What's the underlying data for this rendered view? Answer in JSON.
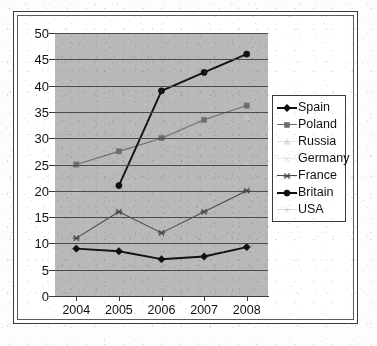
{
  "chart_data": {
    "type": "line",
    "title": "",
    "subtitle": "",
    "xlabel": "",
    "ylabel": "",
    "categories": [
      "2004",
      "2005",
      "2006",
      "2007",
      "2008"
    ],
    "x_tick_labels": [
      "2004",
      "2005",
      "2006",
      "2007",
      "2008"
    ],
    "y_tick_labels": [
      "0",
      "5",
      "10",
      "15",
      "20",
      "25",
      "30",
      "35",
      "40",
      "45",
      "50"
    ],
    "y_ticks": [
      0,
      5,
      10,
      15,
      20,
      25,
      30,
      35,
      40,
      45,
      50
    ],
    "ylim": [
      0,
      50
    ],
    "grid": "horizontal",
    "legend_position": "right",
    "plot_background": "#b9b9b9",
    "series": [
      {
        "name": "Spain",
        "marker": "diamond",
        "color": "#111111",
        "line_weight": "bold",
        "values": [
          9,
          8.5,
          7,
          7.5,
          9.3
        ]
      },
      {
        "name": "Poland",
        "marker": "square",
        "color": "#6e6e6e",
        "line_weight": "normal",
        "values": [
          25,
          27.5,
          30,
          33.5,
          36.2
        ]
      },
      {
        "name": "Russia",
        "marker": "triangle",
        "color": "#c9c9c9",
        "line_weight": "faint",
        "values": [
          null,
          null,
          null,
          null,
          34
        ]
      },
      {
        "name": "Germany",
        "marker": "cross",
        "color": "#d4d4d4",
        "line_weight": "faint",
        "values": [
          20,
          null,
          29.8,
          null,
          25
        ]
      },
      {
        "name": "France",
        "marker": "star",
        "color": "#4a4a4a",
        "line_weight": "normal",
        "values": [
          11,
          16,
          12,
          16,
          20
        ]
      },
      {
        "name": "Britain",
        "marker": "circle",
        "color": "#111111",
        "line_weight": "bold",
        "values": [
          null,
          21,
          39,
          42.5,
          46
        ]
      },
      {
        "name": "USA",
        "marker": "plus",
        "color": "#bdbdbd",
        "line_weight": "faint",
        "values": [
          9,
          8.5,
          7,
          7.2,
          7.5
        ]
      }
    ]
  },
  "legend": {
    "items": [
      {
        "label": "Spain"
      },
      {
        "label": "Poland"
      },
      {
        "label": "Russia"
      },
      {
        "label": "Germany"
      },
      {
        "label": "France"
      },
      {
        "label": "Britain"
      },
      {
        "label": "USA"
      }
    ]
  }
}
